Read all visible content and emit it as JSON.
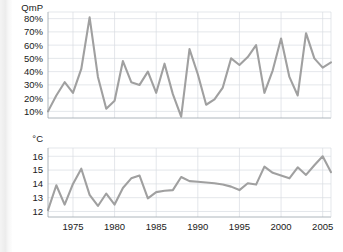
{
  "figure": {
    "background_color": "#ffffff",
    "line_color": "#a0a0a0",
    "grid_color": "#d8dde2"
  },
  "chart_data": [
    {
      "type": "line",
      "id": "precipitation-quotient",
      "title": "",
      "xlabel": "",
      "ylabel": "QmP",
      "yunit_label": "QmP",
      "grid": true,
      "legend": "none",
      "xlim": [
        1972,
        2006
      ],
      "ylim": [
        5,
        85
      ],
      "yticks": [
        10,
        20,
        30,
        40,
        50,
        60,
        70,
        80
      ],
      "ytick_labels": [
        "10%",
        "20%",
        "30%",
        "40%",
        "50%",
        "60%",
        "70%",
        "80%"
      ],
      "xticks": [
        1975,
        1980,
        1985,
        1990,
        1995,
        2000,
        2005
      ],
      "xtick_labels": [
        "1975",
        "1980",
        "1985",
        "1990",
        "1995",
        "2000",
        "2005"
      ],
      "x": [
        1972,
        1973,
        1974,
        1975,
        1976,
        1977,
        1978,
        1979,
        1980,
        1981,
        1982,
        1983,
        1984,
        1985,
        1986,
        1987,
        1988,
        1989,
        1990,
        1991,
        1992,
        1993,
        1994,
        1995,
        1996,
        1997,
        1998,
        1999,
        2000,
        2001,
        2002,
        2003,
        2004,
        2005,
        2006
      ],
      "values": [
        10,
        22,
        32,
        24,
        42,
        81,
        36,
        12,
        18,
        48,
        32,
        30,
        40,
        24,
        46,
        23,
        6,
        57,
        38,
        15,
        19,
        28,
        50,
        45,
        51,
        60,
        24,
        41,
        65,
        36,
        22,
        69,
        50,
        43,
        47
      ],
      "series": [
        {
          "name": "QmP",
          "values": [
            10,
            22,
            32,
            24,
            42,
            81,
            36,
            12,
            18,
            48,
            32,
            30,
            40,
            24,
            46,
            23,
            6,
            57,
            38,
            15,
            19,
            28,
            50,
            45,
            51,
            60,
            24,
            41,
            65,
            36,
            22,
            69,
            50,
            43,
            47
          ]
        }
      ]
    },
    {
      "type": "line",
      "id": "temperature",
      "title": "",
      "xlabel": "",
      "ylabel": "°C",
      "yunit_label": "°C",
      "grid": true,
      "legend": "none",
      "xlim": [
        1972,
        2006
      ],
      "ylim": [
        11.6,
        16.6
      ],
      "yticks": [
        12,
        13,
        14,
        15,
        16
      ],
      "ytick_labels": [
        "12",
        "13",
        "14",
        "15",
        "16"
      ],
      "xticks": [
        1975,
        1980,
        1985,
        1990,
        1995,
        2000,
        2005
      ],
      "xtick_labels": [
        "1975",
        "1980",
        "1985",
        "1990",
        "1995",
        "2000",
        "2005"
      ],
      "x": [
        1972,
        1973,
        1974,
        1975,
        1976,
        1977,
        1978,
        1979,
        1980,
        1981,
        1982,
        1983,
        1984,
        1985,
        1986,
        1987,
        1988,
        1989,
        1990,
        1991,
        1992,
        1993,
        1994,
        1995,
        1996,
        1997,
        1998,
        1999,
        2000,
        2001,
        2002,
        2003,
        2004,
        2005,
        2006
      ],
      "values": [
        12.1,
        13.9,
        12.5,
        14.0,
        15.1,
        13.2,
        12.4,
        13.3,
        12.5,
        13.7,
        14.4,
        14.6,
        12.95,
        13.4,
        13.5,
        13.55,
        14.5,
        14.2,
        14.15,
        14.1,
        14.05,
        13.95,
        13.8,
        13.55,
        14.05,
        13.95,
        15.25,
        14.8,
        14.6,
        14.4,
        15.2,
        14.65,
        15.35,
        16.0,
        14.85
      ],
      "series": [
        {
          "name": "Temperature",
          "values": [
            12.1,
            13.9,
            12.5,
            14.0,
            15.1,
            13.2,
            12.4,
            13.3,
            12.5,
            13.7,
            14.4,
            14.6,
            12.95,
            13.4,
            13.5,
            13.55,
            14.5,
            14.2,
            14.15,
            14.1,
            14.05,
            13.95,
            13.8,
            13.55,
            14.05,
            13.95,
            15.25,
            14.8,
            14.6,
            14.4,
            15.2,
            14.65,
            15.35,
            16.0,
            14.85
          ]
        }
      ]
    }
  ]
}
